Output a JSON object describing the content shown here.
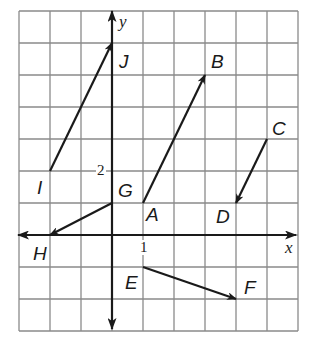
{
  "diagram": {
    "type": "coordinate-plane-vectors",
    "grid": {
      "x_min": -3,
      "x_max": 6,
      "y_min": -3,
      "y_max": 7,
      "origin_px": [
        112,
        235
      ],
      "unit_px": [
        31,
        32
      ],
      "line_color": "#8a8a8a",
      "axis_color": "#1a1a1a"
    },
    "axes": {
      "x_label": "x",
      "y_label": "y",
      "tick_labels": [
        {
          "text": "1",
          "axis": "x",
          "value": 1
        },
        {
          "text": "2",
          "axis": "y",
          "value": 2
        }
      ]
    },
    "points": [
      {
        "name": "A",
        "x": 1,
        "y": 1
      },
      {
        "name": "B",
        "x": 3,
        "y": 5
      },
      {
        "name": "C",
        "x": 5,
        "y": 3
      },
      {
        "name": "D",
        "x": 4,
        "y": 1
      },
      {
        "name": "E",
        "x": 1,
        "y": -1
      },
      {
        "name": "F",
        "x": 4,
        "y": -2
      },
      {
        "name": "G",
        "x": 0,
        "y": 1
      },
      {
        "name": "H",
        "x": -2,
        "y": 0
      },
      {
        "name": "I",
        "x": -2,
        "y": 2
      },
      {
        "name": "J",
        "x": 0,
        "y": 6
      }
    ],
    "vectors": [
      {
        "from": "A",
        "to": "B"
      },
      {
        "from": "C",
        "to": "D"
      },
      {
        "from": "E",
        "to": "F"
      },
      {
        "from": "G",
        "to": "H"
      },
      {
        "from": "I",
        "to": "J"
      }
    ],
    "labels": {
      "A": "A",
      "B": "B",
      "C": "C",
      "D": "D",
      "E": "E",
      "F": "F",
      "G": "G",
      "H": "H",
      "I": "I",
      "J": "J"
    }
  }
}
